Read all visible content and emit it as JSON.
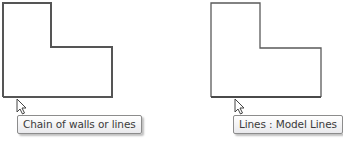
{
  "panels": [
    {
      "name": "left",
      "tooltip": "Chain of walls or lines",
      "shape": "l-shaped-outline",
      "stroke_color": "#555555",
      "stroke_width": 2
    },
    {
      "name": "right",
      "tooltip": "Lines : Model Lines",
      "shape": "l-shaped-outline",
      "stroke_color": "#555555",
      "stroke_width": 1
    }
  ],
  "icons": {
    "cursor": "arrow-pointer-icon"
  }
}
